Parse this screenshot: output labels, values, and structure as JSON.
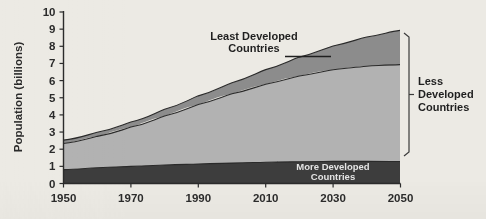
{
  "chart_data": {
    "type": "area",
    "title": "",
    "subtitle": "",
    "xlabel": "",
    "ylabel": "Population (billions)",
    "stacked": true,
    "grid": false,
    "legend_position": "annotations-inline",
    "xlim": [
      1950,
      2050
    ],
    "ylim": [
      0,
      10
    ],
    "x_ticks": [
      "1950",
      "1970",
      "1990",
      "2010",
      "2030",
      "2050"
    ],
    "y_ticks": [
      "0",
      "1",
      "2",
      "3",
      "4",
      "5",
      "6",
      "7",
      "8",
      "9",
      "10"
    ],
    "x": [
      1950,
      1960,
      1970,
      1980,
      1990,
      2000,
      2010,
      2020,
      2030,
      2040,
      2050
    ],
    "series": [
      {
        "name": "More Developed Countries",
        "color": "#3d3d3d",
        "values": [
          0.81,
          0.92,
          1.0,
          1.08,
          1.14,
          1.19,
          1.24,
          1.27,
          1.29,
          1.29,
          1.28
        ]
      },
      {
        "name": "Less Developed Countries (excluding least developed)",
        "color": "#b2b2b2",
        "values": [
          1.52,
          1.83,
          2.29,
          2.86,
          3.47,
          4.04,
          4.55,
          5.0,
          5.34,
          5.55,
          5.65
        ]
      },
      {
        "name": "Least Developed Countries",
        "color": "#8c8c8c",
        "values": [
          0.2,
          0.24,
          0.3,
          0.39,
          0.5,
          0.65,
          0.85,
          1.1,
          1.39,
          1.7,
          2.0
        ]
      }
    ],
    "totals": [
      2.53,
      2.99,
      3.59,
      4.33,
      5.11,
      5.88,
      6.64,
      7.37,
      8.02,
      8.54,
      8.93
    ],
    "annotations": [
      {
        "id": "least-developed-callout",
        "text_line1": "Least Developed",
        "text_line2": "Countries",
        "leader_line": true,
        "target_series": "Least Developed Countries"
      },
      {
        "id": "more-developed-inline",
        "text_line1": "More Developed",
        "text_line2": "Countries",
        "placement": "inside-band",
        "target_series": "More Developed Countries"
      },
      {
        "id": "less-developed-bracket",
        "text_line1": "Less",
        "text_line2": "Developed",
        "text_line3": "Countries",
        "bracket": true,
        "spans_series": [
          "Less Developed Countries (excluding least developed)",
          "Least Developed Countries"
        ]
      }
    ],
    "colors": {
      "more_developed": "#3d3d3d",
      "less_developed": "#b2b2b2",
      "least_developed": "#8c8c8c",
      "axis": "#2b2b2b",
      "background": "#eceae4",
      "outline": "#2a2a2a"
    }
  }
}
